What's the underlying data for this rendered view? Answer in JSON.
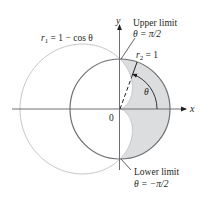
{
  "diagram": {
    "axes": {
      "x_label": "x",
      "y_label": "y",
      "origin_label": "0"
    },
    "curves": [
      {
        "name": "r1",
        "label_var": "r",
        "label_sub": "1",
        "label_expr": " = 1 − cos θ",
        "color": "#bdbdbd"
      },
      {
        "name": "r2",
        "label_var": "r",
        "label_sub": "2",
        "label_expr": " = 1",
        "color": "#6d6e71"
      }
    ],
    "shaded_region_color": "#dcdddf",
    "angle_label": "θ",
    "upper_limit": {
      "title": "Upper limit",
      "expr": "θ = π/2"
    },
    "lower_limit": {
      "title": "Lower limit",
      "expr": "θ = −π/2"
    }
  }
}
